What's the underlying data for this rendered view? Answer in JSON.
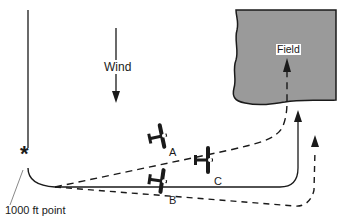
{
  "diagram": {
    "labels": {
      "wind": "Wind",
      "field": "Field",
      "aircraft_a": "A",
      "aircraft_b": "B",
      "aircraft_c": "C",
      "thousand_ft_point": "1000 ft point",
      "key_point_marker": "*"
    },
    "colors": {
      "field_fill": "#9a9a9a",
      "line": "#1a1a1a",
      "background": "#ffffff"
    }
  }
}
